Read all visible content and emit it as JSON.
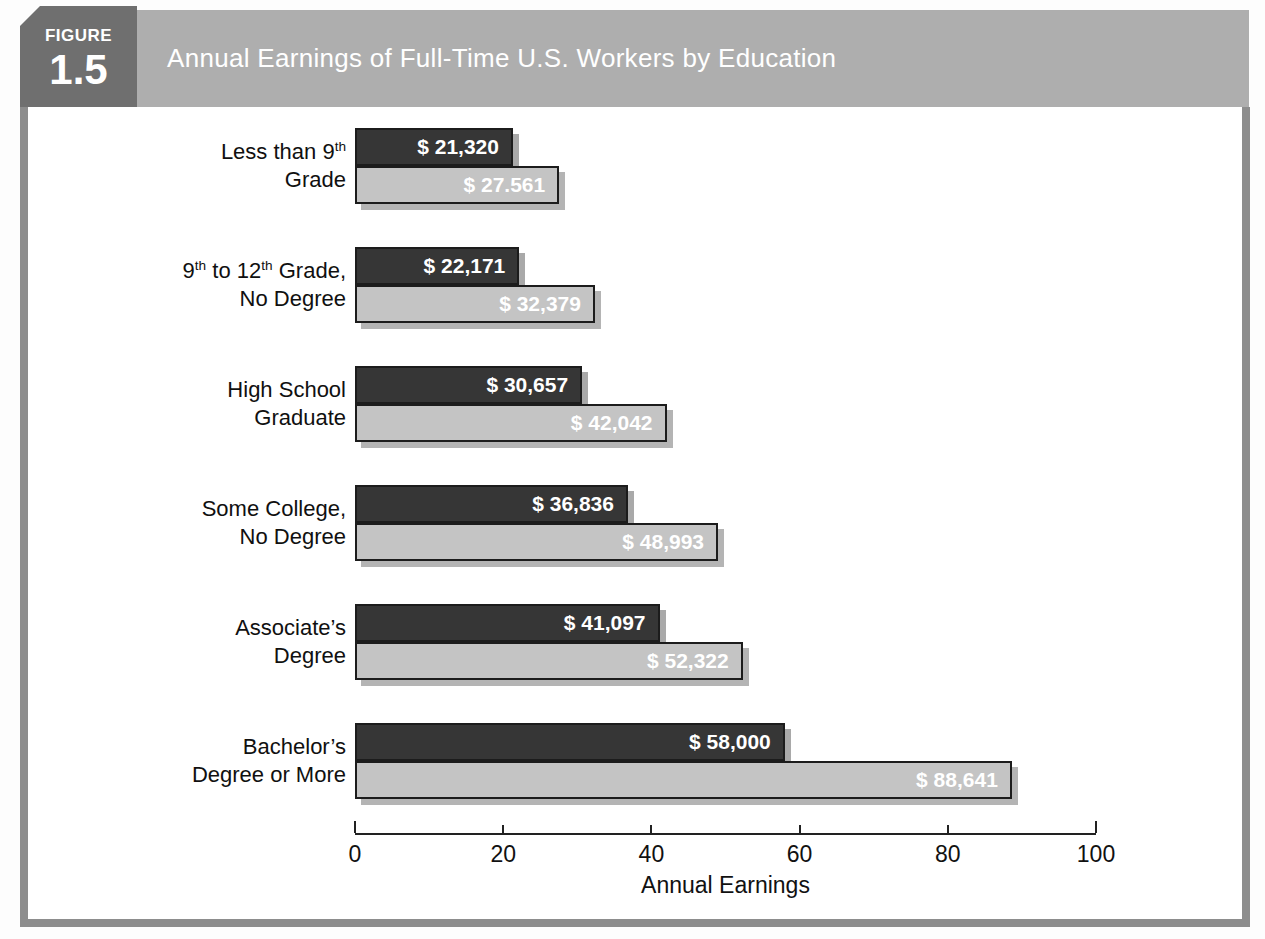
{
  "header": {
    "figure_label": "FIGURE",
    "figure_number": "1.5",
    "title": "Annual Earnings of Full-Time U.S. Workers by Education"
  },
  "colors": {
    "badge_bg": "#6f6f6f",
    "title_bar_bg": "#aeaeae",
    "panel_border": "#8d8d8d",
    "dark_bar": "#363636",
    "light_bar": "#c4c4c4",
    "bar_border": "#1c1c1c",
    "bar_shadow": "#b0b0b0",
    "value_text": "#ffffff"
  },
  "chart_data": {
    "type": "bar",
    "orientation": "horizontal",
    "title": "Annual Earnings of Full-Time U.S. Workers by Education",
    "xlabel": "Annual Earnings",
    "x_ticks": [
      0,
      20,
      40,
      60,
      80,
      100
    ],
    "xlim": [
      0,
      100
    ],
    "grid": false,
    "legend_position": "none",
    "categories": [
      [
        "Less than 9^{th}",
        "Grade"
      ],
      [
        "9^{th} to 12^{th} Grade,",
        "No Degree"
      ],
      [
        "High School",
        "Graduate"
      ],
      [
        "Some College,",
        "No Degree"
      ],
      [
        "Associate’s",
        "Degree"
      ],
      [
        "Bachelor’s",
        "Degree or More"
      ]
    ],
    "series": [
      {
        "key": "dark",
        "color": "#363636",
        "values": [
          21320,
          22171,
          30657,
          36836,
          41097,
          58000
        ],
        "labels": [
          "$ 21,320",
          "$ 22,171",
          "$ 30,657",
          "$ 36,836",
          "$ 41,097",
          "$ 58,000"
        ]
      },
      {
        "key": "light",
        "color": "#c4c4c4",
        "values": [
          27561,
          32379,
          42042,
          48993,
          52322,
          88641
        ],
        "labels": [
          "$ 27.561",
          "$ 32,379",
          "$ 42,042",
          "$ 48,993",
          "$ 52,322",
          "$ 88,641"
        ]
      }
    ]
  }
}
